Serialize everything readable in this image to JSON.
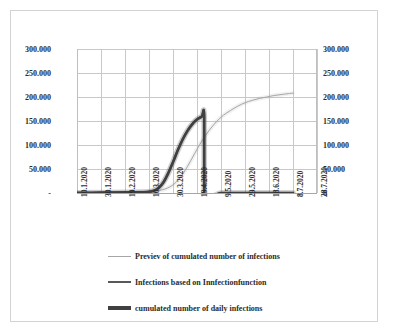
{
  "chart_data": {
    "type": "line",
    "title": "",
    "xlabel": "",
    "ylabel": "",
    "grid": true,
    "legend_position": "bottom-left",
    "ylim": [
      0,
      300000
    ],
    "y_ticks": [
      0,
      50000,
      100000,
      150000,
      200000,
      250000,
      300000
    ],
    "y_axis_left": {
      "tick_labels": [
        "-",
        "50.000",
        "100.000",
        "150.000",
        "200.000",
        "250.000",
        "300.000"
      ]
    },
    "y_axis_right": {
      "tick_labels": [
        "0",
        "50.000",
        "100.000",
        "150.000",
        "200.000",
        "250.000",
        "300.000"
      ]
    },
    "x_tick_labels": [
      "10.1.2020",
      "30.1.2020",
      "19.2.2020",
      "10.3.2020",
      "30.3.2020",
      "19.4.2020",
      "9.5.2020",
      "29.5.2020",
      "18.6.2020",
      "8.7.2020",
      "28.7.2020"
    ],
    "x_domain_days": [
      0,
      200
    ],
    "series": [
      {
        "name": "Previev of cumulated number of infections",
        "color": "#a6a6a6",
        "width": 1,
        "x_days": [
          50,
          56,
          62,
          68,
          74,
          80,
          86,
          92,
          98,
          104,
          110,
          116,
          122,
          128,
          134,
          140,
          146,
          152,
          158,
          164,
          170,
          176,
          180
        ],
        "values": [
          1500,
          2200,
          3300,
          5000,
          9000,
          17000,
          32000,
          55000,
          82000,
          108000,
          130000,
          148000,
          162000,
          172000,
          181000,
          188000,
          193000,
          197000,
          200000,
          203000,
          205000,
          207000,
          208000
        ]
      },
      {
        "name": "Infections based on Innfectionfunction",
        "color": "#595959",
        "width": 2,
        "x_days": [
          0,
          20,
          40,
          55,
          60,
          64,
          68,
          72,
          76,
          80,
          84,
          88,
          92,
          96,
          100,
          104,
          106,
          106,
          120,
          140,
          160,
          180
        ],
        "values": [
          500,
          900,
          1300,
          1800,
          2600,
          5000,
          11000,
          23000,
          42000,
          65000,
          90000,
          112000,
          130000,
          144000,
          154000,
          160000,
          162000,
          0,
          0,
          0,
          0,
          0
        ]
      },
      {
        "name": "cumulated number of daily infections",
        "color": "#404040",
        "width": 2.6,
        "x_days": [
          0,
          20,
          40,
          55,
          60,
          64,
          68,
          72,
          76,
          80,
          84,
          88,
          92,
          96,
          100,
          104,
          106,
          106,
          120,
          140,
          160,
          180
        ],
        "values": [
          400,
          800,
          1200,
          1700,
          2400,
          4600,
          10500,
          22000,
          41000,
          64000,
          89000,
          111000,
          129000,
          143000,
          153000,
          159000,
          161000,
          0,
          0,
          0,
          0,
          0
        ]
      }
    ]
  },
  "legend": {
    "entries": [
      {
        "label": "Previev of cumulated number of infections"
      },
      {
        "label": "Infections based on Innfectionfunction"
      },
      {
        "label": "cumulated number of daily infections"
      }
    ]
  },
  "colors": {
    "series_preview": "#a6a6a6",
    "series_infection_function": "#595959",
    "series_cumulated_daily": "#404040",
    "gridline": "#c8c8c8",
    "axis": "#a6a6a6",
    "frame": "#d3d3d3",
    "text": "#2b2b2b",
    "background": "#ffffff"
  }
}
